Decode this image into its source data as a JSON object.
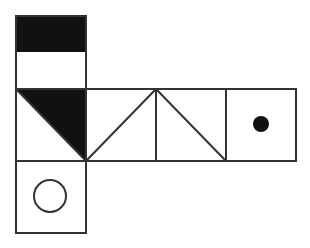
{
  "diagram": {
    "type": "cube-net",
    "colors": {
      "stroke": "#333333",
      "fill": "#111111",
      "background": "#ffffff"
    },
    "faces": [
      {
        "id": "top",
        "pattern": "half-black-top"
      },
      {
        "id": "left",
        "pattern": "black-triangle-top-right"
      },
      {
        "id": "middle1",
        "pattern": "diagonal-bottom-left-to-top-right"
      },
      {
        "id": "middle2",
        "pattern": "diagonal-top-left-to-bottom-right"
      },
      {
        "id": "right",
        "pattern": "filled-dot"
      },
      {
        "id": "bottom",
        "pattern": "hollow-circle"
      }
    ]
  }
}
